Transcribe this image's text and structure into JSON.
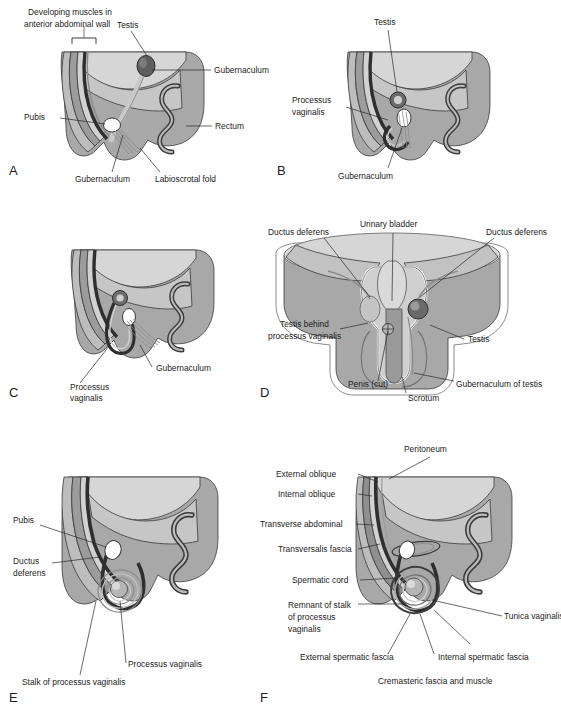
{
  "figure": {
    "background": "#ffffff",
    "palette": {
      "lightest": "#e3e3e3",
      "light": "#cfcfcf",
      "mid": "#b3b3b3",
      "midgray": "#a0a0a0",
      "dark": "#6f6f6f",
      "darkest": "#3a3a3a",
      "outline": "#2a2a2a",
      "white": "#ffffff",
      "text": "#1c1c1c"
    }
  },
  "panels": [
    {
      "id": "A",
      "letter": "A",
      "labels": [
        {
          "name": "developing-muscles",
          "text": "Developing muscles in"
        },
        {
          "name": "developing-muscles-2",
          "text": "anterior abdominal wall"
        },
        {
          "name": "testis",
          "text": "Testis"
        },
        {
          "name": "gubernaculum-upper",
          "text": "Gubernaculum"
        },
        {
          "name": "pubis",
          "text": "Pubis"
        },
        {
          "name": "rectum",
          "text": "Rectum"
        },
        {
          "name": "gubernaculum-lower",
          "text": "Gubernaculum"
        },
        {
          "name": "labioscrotal-fold",
          "text": "Labioscrotal fold"
        }
      ]
    },
    {
      "id": "B",
      "letter": "B",
      "labels": [
        {
          "name": "testis",
          "text": "Testis"
        },
        {
          "name": "processus-vaginalis",
          "text": "Processus"
        },
        {
          "name": "processus-vaginalis-2",
          "text": "vaginalis"
        },
        {
          "name": "gubernaculum",
          "text": "Gubernaculum"
        }
      ]
    },
    {
      "id": "C",
      "letter": "C",
      "labels": [
        {
          "name": "gubernaculum",
          "text": "Gubernaculum"
        },
        {
          "name": "processus-vaginalis",
          "text": "Processus"
        },
        {
          "name": "processus-vaginalis-2",
          "text": "vaginalis"
        }
      ]
    },
    {
      "id": "D",
      "letter": "D",
      "labels": [
        {
          "name": "urinary-bladder",
          "text": "Urinary bladder"
        },
        {
          "name": "ductus-deferens-left",
          "text": "Ductus deferens"
        },
        {
          "name": "ductus-deferens-right",
          "text": "Ductus deferens"
        },
        {
          "name": "testis-behind",
          "text": "Testis behind"
        },
        {
          "name": "testis-behind-2",
          "text": "processus vaginalis"
        },
        {
          "name": "testis",
          "text": "Testis"
        },
        {
          "name": "penis-cut",
          "text": "Penis (cut)"
        },
        {
          "name": "scrotum",
          "text": "Scrotum"
        },
        {
          "name": "gubernaculum-of-testis",
          "text": "Gubernaculum of testis"
        }
      ]
    },
    {
      "id": "E",
      "letter": "E",
      "labels": [
        {
          "name": "pubis",
          "text": "Pubis"
        },
        {
          "name": "ductus-deferens",
          "text": "Ductus"
        },
        {
          "name": "ductus-deferens-2",
          "text": "deferens"
        },
        {
          "name": "processus-vaginalis",
          "text": "Processus vaginalis"
        },
        {
          "name": "stalk-of-processus-vaginalis",
          "text": "Stalk of processus vaginalis"
        }
      ]
    },
    {
      "id": "F",
      "letter": "F",
      "labels": [
        {
          "name": "peritoneum",
          "text": "Peritoneum"
        },
        {
          "name": "external-oblique",
          "text": "External oblique"
        },
        {
          "name": "internal-oblique",
          "text": "Internal oblique"
        },
        {
          "name": "transverse-abdominal",
          "text": "Transverse abdominal"
        },
        {
          "name": "transversalis-fascia",
          "text": "Transversalis fascia"
        },
        {
          "name": "spermatic-cord",
          "text": "Spermatic cord"
        },
        {
          "name": "remnant-of-stalk",
          "text": "Remnant of stalk"
        },
        {
          "name": "remnant-of-stalk-2",
          "text": "of processus"
        },
        {
          "name": "remnant-of-stalk-3",
          "text": "vaginalis"
        },
        {
          "name": "tunica-vaginalis",
          "text": "Tunica vaginalis"
        },
        {
          "name": "external-spermatic-fascia",
          "text": "External spermatic fascia"
        },
        {
          "name": "internal-spermatic-fascia",
          "text": "Internal spermatic fascia"
        },
        {
          "name": "cremasteric-fascia",
          "text": "Cremasteric fascia and muscle"
        }
      ]
    }
  ]
}
